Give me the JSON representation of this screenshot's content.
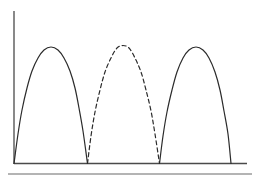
{
  "figure": {
    "background_color": "#ffffff",
    "width": 258,
    "height": 182,
    "title": "",
    "subtitle": ""
  },
  "style": {
    "curve_color": "#2b2b2b",
    "axis_color": "#4a4a4a",
    "baseline_color": "#4a4a4a",
    "rule_color": "#6a6a6a",
    "curve_width": 1.2,
    "axis_width": 1.3,
    "dash_pattern": "4,3"
  },
  "axes": {
    "y_axis": {
      "name": "y-axis",
      "x": 14,
      "y_top": 11,
      "y_bottom": 164,
      "label": "",
      "ticks": [],
      "visible": true
    },
    "x_axis": {
      "name": "baseline",
      "y": 163.5,
      "x_left": 14,
      "x_right": 247,
      "label": "",
      "ticks": [],
      "visible": true
    },
    "lower_rule": {
      "name": "lower-rule",
      "y": 174,
      "x_left": 8,
      "x_right": 252,
      "visible": true
    }
  },
  "chart_data": {
    "type": "line",
    "title": "",
    "subtitle": "",
    "xlabel": "",
    "ylabel": "",
    "xlim": [
      14,
      247
    ],
    "ylim": [
      163.5,
      11
    ],
    "grid": false,
    "legend": "none",
    "baseline_y": 163.5,
    "series": [
      {
        "name": "lobe-1",
        "linestyle": "solid",
        "color": "#2b2b2b",
        "x_start": 14,
        "x_end": 87.5,
        "peak_x": 51,
        "peak_y": 47,
        "amplitude": 116.5,
        "points": [
          [
            14,
            163.5
          ],
          [
            18,
            134
          ],
          [
            22,
            110
          ],
          [
            27,
            88
          ],
          [
            32,
            71
          ],
          [
            38,
            58
          ],
          [
            44,
            50
          ],
          [
            51,
            47
          ],
          [
            58,
            50
          ],
          [
            64,
            58
          ],
          [
            70,
            71
          ],
          [
            75,
            88
          ],
          [
            79,
            108
          ],
          [
            83,
            131
          ],
          [
            87.5,
            163.5
          ]
        ]
      },
      {
        "name": "lobe-2",
        "linestyle": "dashed",
        "color": "#2b2b2b",
        "x_start": 87.5,
        "x_end": 159.5,
        "peak_x": 123,
        "peak_y": 45.5,
        "amplitude": 118,
        "points": [
          [
            87.5,
            163.5
          ],
          [
            91,
            136
          ],
          [
            95,
            112
          ],
          [
            100,
            90
          ],
          [
            105,
            72
          ],
          [
            111,
            58
          ],
          [
            117,
            48
          ],
          [
            123,
            45.5
          ],
          [
            129,
            48
          ],
          [
            135,
            58
          ],
          [
            141,
            72
          ],
          [
            146,
            90
          ],
          [
            151,
            111
          ],
          [
            155,
            134
          ],
          [
            159.5,
            163.5
          ]
        ]
      },
      {
        "name": "lobe-3",
        "linestyle": "solid",
        "color": "#2b2b2b",
        "x_start": 159.5,
        "x_end": 231,
        "peak_x": 196,
        "peak_y": 47,
        "amplitude": 116.5,
        "points": [
          [
            159.5,
            163.5
          ],
          [
            163,
            136
          ],
          [
            167,
            112
          ],
          [
            172,
            90
          ],
          [
            177,
            72
          ],
          [
            183,
            58
          ],
          [
            189,
            50
          ],
          [
            196,
            47
          ],
          [
            203,
            50
          ],
          [
            209,
            58
          ],
          [
            215,
            72
          ],
          [
            220,
            90
          ],
          [
            224,
            111
          ],
          [
            228,
            134
          ],
          [
            231,
            163.5
          ]
        ]
      }
    ],
    "annotations": []
  }
}
